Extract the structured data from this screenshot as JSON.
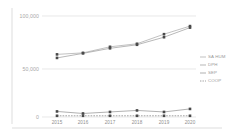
{
  "chart": {
    "title": "",
    "y_axis": {
      "ticks": [
        "100,000",
        "50,000",
        "0"
      ],
      "min": 0,
      "max": 100000
    },
    "x_axis": {
      "ticks": [
        "2015",
        "2016",
        "2017",
        "2018",
        "2019",
        "2020"
      ]
    },
    "legend": {
      "items": [
        {
          "label": "SA HUM",
          "color": "#a6a6a6",
          "dashed": false
        },
        {
          "label": "DPH",
          "color": "#9a9a9a",
          "dashed": false
        },
        {
          "label": "SEP",
          "color": "#8f8f8f",
          "dashed": false
        },
        {
          "label": "COOP",
          "color": "#7a7a7a",
          "dashed": true
        }
      ]
    }
  },
  "chart_data": {
    "type": "line",
    "title": "",
    "xlabel": "",
    "ylabel": "",
    "ylim": [
      0,
      100000
    ],
    "grid": true,
    "legend_position": "right",
    "categories": [
      "2015",
      "2016",
      "2017",
      "2018",
      "2019",
      "2020"
    ],
    "series": [
      {
        "name": "SA HUM",
        "color": "#a6a6a6",
        "dashed": false,
        "values": [
          62000,
          63500,
          69500,
          72500,
          82000,
          90000
        ]
      },
      {
        "name": "DPH",
        "color": "#9a9a9a",
        "dashed": false,
        "values": [
          58500,
          63000,
          68000,
          71500,
          79000,
          88500
        ]
      },
      {
        "name": "SEP",
        "color": "#8f8f8f",
        "dashed": false,
        "values": [
          5500,
          3500,
          5000,
          6500,
          5000,
          8000
        ]
      },
      {
        "name": "COOP",
        "color": "#7a7a7a",
        "dashed": true,
        "values": [
          1200,
          1200,
          1200,
          1200,
          1200,
          1200
        ]
      }
    ]
  }
}
